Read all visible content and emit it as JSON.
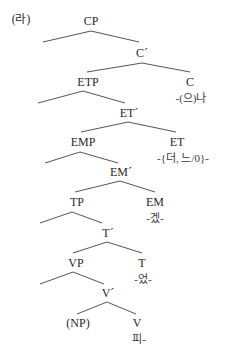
{
  "example_label": "(라)",
  "nodes": {
    "cp": "CP",
    "c_bar": "C´",
    "etp": "ETP",
    "c": "C",
    "c_morph": "-(으)나",
    "et_bar": "ET´",
    "emp": "EMP",
    "et": "ET",
    "et_morph": "-{더, 느/0}-",
    "em_bar": "EM´",
    "tp": "TP",
    "em": "EM",
    "em_morph": "-겠-",
    "t_bar": "T´",
    "vp": "VP",
    "t": "T",
    "t_morph": "-었-",
    "v_bar": "V´",
    "np": "(NP)",
    "v": "V",
    "v_morph": "피-"
  }
}
